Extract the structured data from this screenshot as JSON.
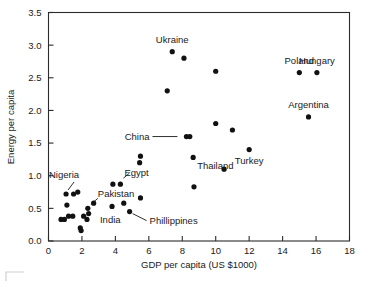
{
  "chart_data": {
    "type": "scatter",
    "title": "",
    "xlabel": "GDP per capita (US $1000)",
    "ylabel": "Energy per capita",
    "xlim": [
      0,
      18
    ],
    "ylim": [
      0,
      3.5
    ],
    "xticks": [
      0,
      2,
      4,
      6,
      8,
      10,
      12,
      14,
      16,
      18
    ],
    "yticks": [
      0.0,
      0.5,
      1.0,
      1.5,
      2.0,
      2.5,
      3.0,
      3.5
    ],
    "xtick_labels": [
      "0",
      "2",
      "4",
      "6",
      "8",
      "10",
      "12",
      "14",
      "16",
      "18"
    ],
    "ytick_labels": [
      "0.0",
      "0.5",
      "1.0",
      "1.5",
      "2.0",
      "2.5",
      "3.0",
      "3.5"
    ],
    "grid": false,
    "legend": "none",
    "marker": "filled-circle",
    "marker_color": "#111111",
    "points": [
      {
        "x": 0.75,
        "y": 0.33,
        "label": ""
      },
      {
        "x": 0.95,
        "y": 0.33,
        "label": ""
      },
      {
        "x": 1.05,
        "y": 0.72,
        "label": "Nigeria"
      },
      {
        "x": 1.1,
        "y": 0.55,
        "label": ""
      },
      {
        "x": 1.2,
        "y": 0.38,
        "label": ""
      },
      {
        "x": 1.45,
        "y": 0.38,
        "label": ""
      },
      {
        "x": 1.5,
        "y": 0.72,
        "label": ""
      },
      {
        "x": 1.75,
        "y": 0.75,
        "label": ""
      },
      {
        "x": 1.9,
        "y": 0.2,
        "label": ""
      },
      {
        "x": 1.95,
        "y": 0.16,
        "label": ""
      },
      {
        "x": 2.1,
        "y": 0.38,
        "label": ""
      },
      {
        "x": 2.3,
        "y": 0.33,
        "label": ""
      },
      {
        "x": 2.35,
        "y": 0.5,
        "label": "Pakistan"
      },
      {
        "x": 2.4,
        "y": 0.42,
        "label": ""
      },
      {
        "x": 2.7,
        "y": 0.58,
        "label": ""
      },
      {
        "x": 3.8,
        "y": 0.53,
        "label": ""
      },
      {
        "x": 3.85,
        "y": 0.87,
        "label": ""
      },
      {
        "x": 4.3,
        "y": 0.87,
        "label": "Egypt"
      },
      {
        "x": 4.5,
        "y": 0.58,
        "label": ""
      },
      {
        "x": 4.85,
        "y": 0.45,
        "label": "India"
      },
      {
        "x": 5.5,
        "y": 0.66,
        "label": ""
      },
      {
        "x": 5.45,
        "y": 1.2,
        "label": ""
      },
      {
        "x": 5.5,
        "y": 1.3,
        "label": ""
      },
      {
        "x": 7.1,
        "y": 2.3,
        "label": ""
      },
      {
        "x": 7.4,
        "y": 2.9,
        "label": "Ukraine"
      },
      {
        "x": 8.1,
        "y": 2.8,
        "label": ""
      },
      {
        "x": 8.25,
        "y": 1.6,
        "label": "China"
      },
      {
        "x": 8.45,
        "y": 1.6,
        "label": ""
      },
      {
        "x": 8.65,
        "y": 1.28,
        "label": "Thailand"
      },
      {
        "x": 8.7,
        "y": 0.83,
        "label": ""
      },
      {
        "x": 10.0,
        "y": 2.6,
        "label": ""
      },
      {
        "x": 10.0,
        "y": 1.8,
        "label": ""
      },
      {
        "x": 10.5,
        "y": 1.1,
        "label": ""
      },
      {
        "x": 11.0,
        "y": 1.7,
        "label": ""
      },
      {
        "x": 12.0,
        "y": 1.4,
        "label": "Turkey"
      },
      {
        "x": 15.0,
        "y": 2.58,
        "label": "Poland"
      },
      {
        "x": 15.55,
        "y": 1.9,
        "label": "Argentina"
      },
      {
        "x": 16.05,
        "y": 2.58,
        "label": "Hungary"
      }
    ],
    "annotations": [
      {
        "text": "Ukraine",
        "x": 7.4,
        "y": 2.9,
        "anchor": "above",
        "leader": false
      },
      {
        "text": "Poland",
        "x": 15.0,
        "y": 2.58,
        "anchor": "above",
        "leader": false
      },
      {
        "text": "Hungary",
        "x": 16.05,
        "y": 2.58,
        "anchor": "above",
        "leader": false
      },
      {
        "text": "Argentina",
        "x": 15.55,
        "y": 1.9,
        "anchor": "above",
        "leader": false
      },
      {
        "text": "China",
        "x": 8.25,
        "y": 1.6,
        "anchor": "left",
        "leader": true
      },
      {
        "text": "Thailand",
        "x": 8.65,
        "y": 1.28,
        "anchor": "below-right",
        "leader": false
      },
      {
        "text": "Turkey",
        "x": 12.0,
        "y": 1.4,
        "anchor": "below",
        "leader": false
      },
      {
        "text": "Egypt",
        "x": 4.3,
        "y": 0.87,
        "anchor": "above-right",
        "leader": true
      },
      {
        "text": "Nigeria",
        "x": 1.05,
        "y": 0.72,
        "anchor": "above",
        "leader": true
      },
      {
        "text": "Pakistan",
        "x": 2.35,
        "y": 0.5,
        "anchor": "above-right",
        "leader": true
      },
      {
        "text": "India",
        "x": 4.85,
        "y": 0.45,
        "anchor": "below-left",
        "leader": false
      },
      {
        "text": "Phillippines",
        "x": 4.85,
        "y": 0.45,
        "anchor": "right",
        "leader": true
      }
    ]
  },
  "axis": {
    "x_title": "GDP per capita (US $1000)",
    "y_title": "Energy per capita"
  },
  "labels": {
    "nigeria": "Nigeria",
    "pakistan": "Pakistan",
    "india": "India",
    "phillippines": "Phillippines",
    "egypt": "Egypt",
    "china": "China",
    "thailand": "Thailand",
    "ukraine": "Ukraine",
    "turkey": "Turkey",
    "poland": "Poland",
    "hungary": "Hungary",
    "argentina": "Argentina"
  },
  "colors": {
    "marker": "#111111",
    "axis": "#2b2b2b",
    "text": "#1a1a1a",
    "background": "#ffffff",
    "corner_mark": "#cfcfcf"
  }
}
